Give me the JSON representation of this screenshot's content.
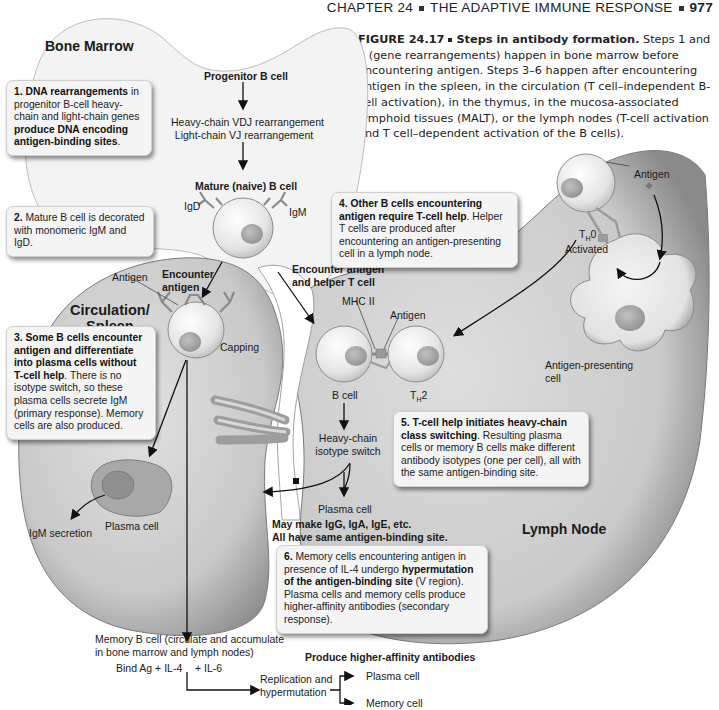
{
  "header": {
    "chapter": "CHAPTER 24",
    "title": "THE ADAPTIVE IMMUNE RESPONSE",
    "page_number": "977"
  },
  "caption": {
    "figure_label": "FIGURE 24.17",
    "figure_title": "Steps in antibody formation.",
    "text": "Steps 1 and 2 (gene rearrangements) happen in bone marrow before encountering antigen. Steps 3–6 happen after encountering antigen in the spleen, in the circulation (T cell–independent B-cell activation), in the thymus, in the mucosa-associated lymphoid tissues (MALT), or the lymph nodes (T-cell activation and T cell–dependent activation of the B cells)."
  },
  "regions": {
    "bone_marrow": "Bone Marrow",
    "circulation_spleen_1": "Circulation/",
    "circulation_spleen_2": "Spleen",
    "lymph_node": "Lymph Node"
  },
  "labels": {
    "progenitor_b_cell": "Progenitor B cell",
    "heavy_chain_vdj": "Heavy-chain VDJ rearrangement",
    "light_chain_vj": "Light-chain VJ rearrangement",
    "mature_b_cell": "Mature (naive) B cell",
    "igd": "IgD",
    "igm": "IgM",
    "antigen_circ": "Antigen",
    "encounter_antigen_1": "Encounter",
    "encounter_antigen_2": "antigen",
    "capping": "Capping",
    "plasma_cell_left": "Plasma cell",
    "igm_secretion": "IgM secretion",
    "encounter_helper_1": "Encounter antigen",
    "encounter_helper_2": "and helper T cell",
    "mhc_ii": "MHC II",
    "antigen_mid": "Antigen",
    "b_cell": "B cell",
    "th2": "T",
    "th2_sub": "H",
    "th2_suffix": "2",
    "th0": "T",
    "th0_sub": "H",
    "th0_suffix": "0",
    "activated": "Activated",
    "antigen_right": "Antigen",
    "apc_1": "Antigen-presenting",
    "apc_2": "cell",
    "heavy_chain_switch_1": "Heavy-chain",
    "heavy_chain_switch_2": "isotype switch",
    "plasma_cell_mid": "Plasma cell",
    "may_make": "May make IgG, IgA, IgE, etc.",
    "all_have": "All have same antigen-binding site.",
    "memory_b_cell_1": "Memory B cell (circulate and accumulate",
    "memory_b_cell_2": "in bone marrow and lymph nodes)",
    "bind_ag": "Bind Ag + IL-4",
    "il6": "+ IL-6",
    "replication_1": "Replication and",
    "replication_2": "hypermutation",
    "produce_higher": "Produce higher-affinity antibodies",
    "out_plasma": "Plasma cell",
    "out_memory": "Memory cell"
  },
  "steps": [
    {
      "num": "1.",
      "bold": "DNA rearrangements",
      "text1": " in progenitor B-cell heavy-chain and light-chain genes ",
      "bold2": "produce DNA encoding antigen-binding sites",
      "text2": "."
    },
    {
      "num": "2.",
      "text1": " Mature B cell is decorated with monomeric IgM and IgD."
    },
    {
      "num": "3.",
      "bold": "Some B cells encounter antigen and differentiate into plasma cells without T-cell help",
      "text1": ". There is no isotype switch, so these plasma cells secrete IgM (primary response). Memory cells are also produced."
    },
    {
      "num": "4.",
      "bold": "Other B cells encountering antigen require T-cell help",
      "text1": ". Helper T cells are produced after encountering an antigen-presenting cell in a lymph node."
    },
    {
      "num": "5.",
      "bold": "T-cell help initiates heavy-chain class switching",
      "text1": ". Resulting plasma cells or memory B cells make different antibody isotypes (one per cell), all with the same antigen-binding site."
    },
    {
      "num": "6.",
      "text1": " Memory cells encountering antigen in presence of IL-4 undergo ",
      "bold": "hypermutation of the antigen-binding site",
      "text2": " (V region). Plasma cells and memory cells produce higher-affinity antibodies (secondary response)."
    }
  ],
  "colors": {
    "tissue_fill": "#c9c9c9",
    "tissue_dark": "#9a9a9a",
    "bone_fill": "#f2f2f2",
    "cell_fill": "#e6e6e6",
    "nucleus": "#a8a8a8",
    "box_bg": "#f4f4f4",
    "arrow": "#111111"
  }
}
